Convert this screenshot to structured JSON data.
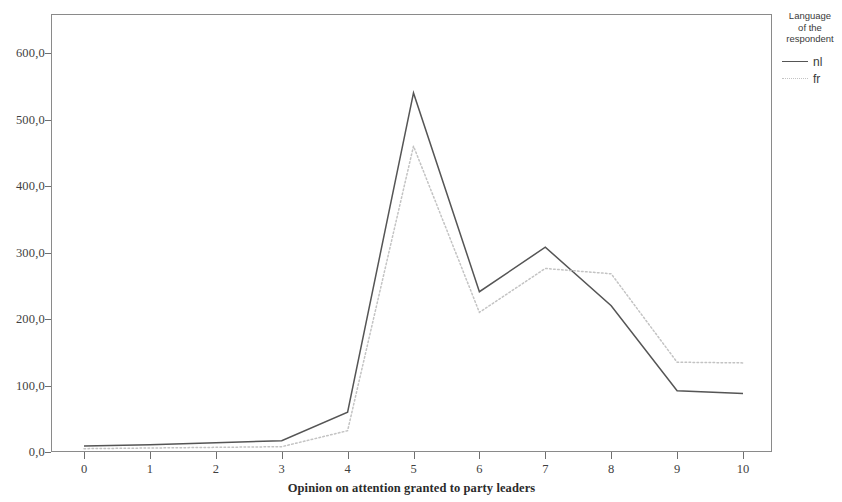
{
  "chart_data": {
    "type": "line",
    "title": "",
    "xlabel": "Opinion on attention granted to party leaders",
    "ylabel": "",
    "x": [
      0,
      1,
      2,
      3,
      4,
      5,
      6,
      7,
      8,
      9,
      10
    ],
    "categories": [
      "0",
      "1",
      "2",
      "3",
      "4",
      "5",
      "6",
      "7",
      "8",
      "9",
      "10"
    ],
    "xlim": [
      0,
      10
    ],
    "ylim": [
      0,
      660
    ],
    "grid": false,
    "y_ticks": [
      0,
      100,
      200,
      300,
      400,
      500,
      600
    ],
    "y_tick_labels": [
      "0,0",
      "100,0",
      "200,0",
      "300,0",
      "400,0",
      "500,0",
      "600,0"
    ],
    "x_tick_labels": [
      "0",
      "1",
      "2",
      "3",
      "4",
      "5",
      "6",
      "7",
      "8",
      "9",
      "10"
    ],
    "legend": {
      "title": "Language of the respondent",
      "title_lines": [
        "Language",
        "of the",
        "respondent"
      ],
      "position": "right",
      "entries": [
        {
          "name": "nl",
          "style": "solid",
          "color": "#555555"
        },
        {
          "name": "fr",
          "style": "dotted",
          "color": "#c3c3c3"
        }
      ]
    },
    "series": [
      {
        "name": "nl",
        "style": "solid",
        "color": "#555555",
        "values": [
          9,
          11,
          14,
          17,
          60,
          540,
          241,
          308,
          220,
          92,
          88
        ]
      },
      {
        "name": "fr",
        "style": "dotted",
        "color": "#c3c3c3",
        "values": [
          5,
          6,
          7,
          8,
          32,
          460,
          210,
          276,
          268,
          135,
          134
        ]
      }
    ]
  }
}
